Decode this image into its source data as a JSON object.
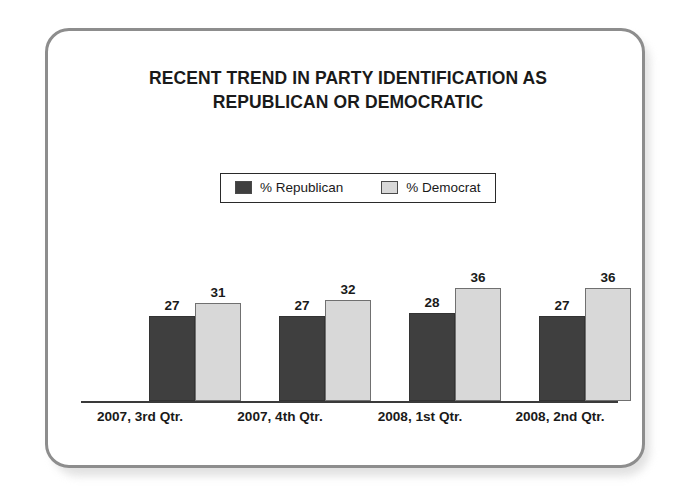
{
  "card": {
    "border_color": "#8d8d8d"
  },
  "title": {
    "line1": "RECENT TREND IN PARTY IDENTIFICATION AS",
    "line2": "REPUBLICAN OR DEMOCRATIC"
  },
  "legend": {
    "items": [
      {
        "label": "% Republican",
        "color": "#3f3f3f"
      },
      {
        "label": "% Democrat",
        "color": "#d8d8d8"
      }
    ]
  },
  "chart_data": {
    "type": "bar",
    "title": "RECENT TREND IN PARTY IDENTIFICATION AS REPUBLICAN OR DEMOCRATIC",
    "xlabel": "",
    "ylabel": "",
    "ylim": [
      0,
      40
    ],
    "grid": false,
    "legend_position": "top-center",
    "categories": [
      "2007, 3rd Qtr.",
      "2007, 4th Qtr.",
      "2008, 1st Qtr.",
      "2008, 2nd Qtr."
    ],
    "series": [
      {
        "name": "% Republican",
        "color": "#3f3f3f",
        "values": [
          27,
          27,
          28,
          27
        ]
      },
      {
        "name": "% Democrat",
        "color": "#d8d8d8",
        "values": [
          31,
          32,
          36,
          36
        ]
      }
    ]
  }
}
